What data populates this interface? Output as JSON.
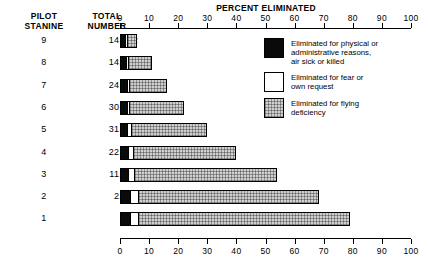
{
  "header": {
    "stanine_label": "PILOT\nSTANINE",
    "total_label": "TOTAL\nNUMBER",
    "axis_title": "PERCENT ELIMINATED"
  },
  "legend": {
    "items": [
      {
        "key": "physical",
        "swatch": "black",
        "label": "Eliminated for physical or\nadministrative reasons,\nair sick or killed",
        "color": "#0a0a0a"
      },
      {
        "key": "fear",
        "swatch": "white",
        "label": "Eliminated for fear or\nown request",
        "color": "#ffffff"
      },
      {
        "key": "flying",
        "swatch": "hatch",
        "label": "Eliminated for flying\ndeficiency",
        "color": "#cfcfcf"
      }
    ]
  },
  "chart_data": {
    "type": "bar",
    "orientation": "horizontal",
    "stacked": true,
    "title": "PERCENT ELIMINATED",
    "xlabel": "PERCENT ELIMINATED",
    "ylabel": "PILOT STANINE",
    "xlim": [
      0,
      100
    ],
    "xticks": [
      0,
      10,
      20,
      30,
      40,
      50,
      60,
      70,
      80,
      90,
      100
    ],
    "xticklabels": [
      "0",
      "10",
      "20",
      "30",
      "40",
      "50",
      "60",
      "70",
      "80",
      "90",
      "100"
    ],
    "grid": false,
    "legend_position": "right",
    "categories": [
      "9",
      "8",
      "7",
      "6",
      "5",
      "4",
      "3",
      "2",
      "1"
    ],
    "totals": [
      "14,682",
      "14,286",
      "24,367",
      "30,066",
      "31,091",
      "22,827",
      "11,471",
      "2,239",
      "904"
    ],
    "series": [
      {
        "name": "Eliminated for physical or administrative reasons, air sick or killed",
        "swatch": "black",
        "values": [
          1.5,
          2.0,
          2.0,
          2.0,
          2.2,
          2.4,
          2.6,
          3.0,
          3.0
        ]
      },
      {
        "name": "Eliminated for fear or own request",
        "swatch": "white",
        "values": [
          1.0,
          1.0,
          1.2,
          1.3,
          1.6,
          2.0,
          2.4,
          3.4,
          3.4
        ]
      },
      {
        "name": "Eliminated for flying deficiency",
        "swatch": "hatch",
        "values": [
          3.5,
          8.0,
          12.8,
          18.7,
          26.2,
          35.6,
          49.0,
          62.1,
          72.6
        ]
      }
    ],
    "row_totals_percent": [
      6,
      11,
      16,
      22,
      30,
      40,
      54,
      68.5,
      79
    ]
  }
}
